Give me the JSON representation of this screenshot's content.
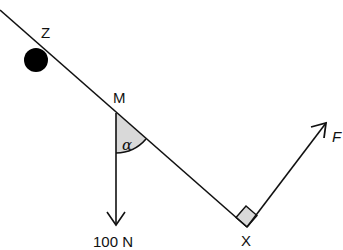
{
  "diagram": {
    "labels": {
      "z": "Z",
      "m": "M",
      "x": "X",
      "alpha": "α",
      "weight": "100 N",
      "force": "F"
    },
    "colors": {
      "line": "#111111",
      "shade": "#d9d9d9",
      "ball": "#000000"
    }
  }
}
